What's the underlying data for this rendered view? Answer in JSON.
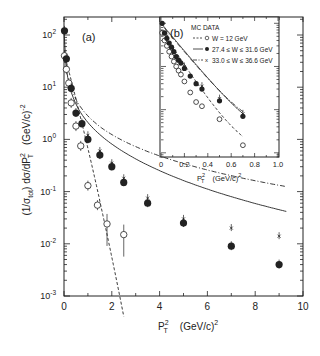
{
  "chart_data": [
    {
      "panel": "(a)",
      "type": "scatter",
      "title": "",
      "xlabel": "P_T^2 (GeV/c)^2",
      "ylabel": "(1/σ_tot) dσ/dP_T^2 (GeV/c)^-2",
      "xlim": [
        0,
        10
      ],
      "ylim": [
        0.001,
        100
      ],
      "yscale": "log",
      "x_ticks": [
        "0",
        "2",
        "4",
        "6",
        "8",
        "10"
      ],
      "y_ticks": [
        "10^-3",
        "10^-2",
        "10^-1",
        "10^0",
        "10^1",
        "10^2"
      ],
      "grid": false,
      "series": [
        {
          "name": "W = 12 GeV",
          "marker": "open-circle",
          "line": "dashed",
          "x": [
            0.02,
            0.1,
            0.2,
            0.3,
            0.5,
            0.7,
            1.0,
            1.4,
            1.8,
            2.5
          ],
          "y": [
            40,
            22,
            12,
            5,
            1.8,
            0.75,
            0.13,
            0.055,
            0.024,
            0.015
          ]
        },
        {
          "name": "27.4 ≤ W ≤ 31.6 GeV",
          "marker": "filled-circle",
          "line": "solid",
          "x": [
            0.02,
            0.1,
            0.3,
            0.5,
            0.75,
            1.0,
            1.5,
            2.0,
            2.5,
            3.5,
            5.0,
            7.0,
            9.0
          ],
          "y": [
            120,
            35,
            9.5,
            3.2,
            2.0,
            1.0,
            0.5,
            0.3,
            0.15,
            0.06,
            0.025,
            0.009,
            0.004
          ]
        },
        {
          "name": "33.0 ≤ W ≤ 36.6 GeV",
          "marker": "cross",
          "line": "dash-dot",
          "x": [
            1.0,
            1.5,
            2.0,
            2.5,
            3.5,
            5.0,
            7.0,
            9.0
          ],
          "y": [
            1.2,
            0.6,
            0.35,
            0.18,
            0.075,
            0.03,
            0.02,
            0.014
          ]
        }
      ],
      "annotations": [
        "(a)"
      ]
    },
    {
      "panel": "(b)",
      "type": "scatter",
      "title": "MC DATA",
      "xlabel": "P_T^2 (GeV/c)^2",
      "xlim": [
        0,
        1.0
      ],
      "yscale": "log",
      "x_ticks": [
        "0",
        "0.2",
        "0.4",
        "0.6",
        "0.8",
        "1.0"
      ],
      "legend": [
        "W = 12 GeV",
        "27.4 ≤ W ≤ 31.6 GeV",
        "33.0 ≤ W ≤ 36.6 GeV"
      ],
      "legend_position": "top-right",
      "series": [
        {
          "name": "W = 12 GeV",
          "marker": "open-circle",
          "line": "dashed",
          "x": [
            0.01,
            0.03,
            0.05,
            0.07,
            0.09,
            0.11,
            0.13,
            0.15,
            0.17,
            0.2,
            0.25,
            0.3,
            0.35,
            0.5,
            0.7
          ],
          "y": [
            60,
            40,
            30,
            22,
            17,
            13,
            10,
            8,
            6.5,
            4.5,
            2.5,
            1.5,
            1.2,
            0.6,
            0.15
          ]
        },
        {
          "name": "27.4 ≤ W ≤ 31.6 GeV",
          "marker": "filled-circle",
          "line": "solid",
          "x": [
            0.01,
            0.03,
            0.05,
            0.07,
            0.09,
            0.11,
            0.13,
            0.15,
            0.17,
            0.2,
            0.25,
            0.3,
            0.35,
            0.5,
            0.7
          ],
          "y": [
            100,
            60,
            45,
            35,
            28,
            22,
            17,
            14,
            12,
            9,
            6,
            4,
            3,
            1.6,
            0.7
          ]
        },
        {
          "name": "33.0 ≤ W ≤ 36.6 GeV",
          "marker": "cross",
          "line": "dash-dot",
          "x": [
            0.05,
            0.1,
            0.2,
            0.35,
            0.5,
            0.7
          ],
          "y": [
            50,
            25,
            10,
            3.5,
            1.8,
            0.8
          ]
        }
      ],
      "annotations": [
        "(b)",
        "MC DATA"
      ]
    }
  ],
  "labels": {
    "panel_a": "(a)",
    "panel_b": "(b)",
    "inset_title": "MC DATA",
    "legend_1": "W = 12 GeV",
    "legend_2": "27.4 ≤ W ≤ 31.6 GeV",
    "legend_3": "33.0 ≤ W ≤ 36.6 GeV",
    "xlabel_P": "P",
    "xlabel_unit": "(GeV/c)",
    "y_label_text": "(1/σ",
    "y_label_tot": "tot",
    "y_label_mid": ")   dσ/dP",
    "y_label_unit": "(GeV/c)",
    "sup2": "2",
    "subT": "T",
    "supm2": "-2"
  },
  "ticks": {
    "main_x": [
      "0",
      "2",
      "4",
      "6",
      "8",
      "10"
    ],
    "main_y_base": "10",
    "main_y_exp": [
      "2",
      "1",
      "0",
      "-1",
      "-2",
      "-3"
    ],
    "inset_x": [
      "0",
      "0.2",
      "0.4",
      "0.6",
      "0.8",
      "1.0"
    ]
  }
}
